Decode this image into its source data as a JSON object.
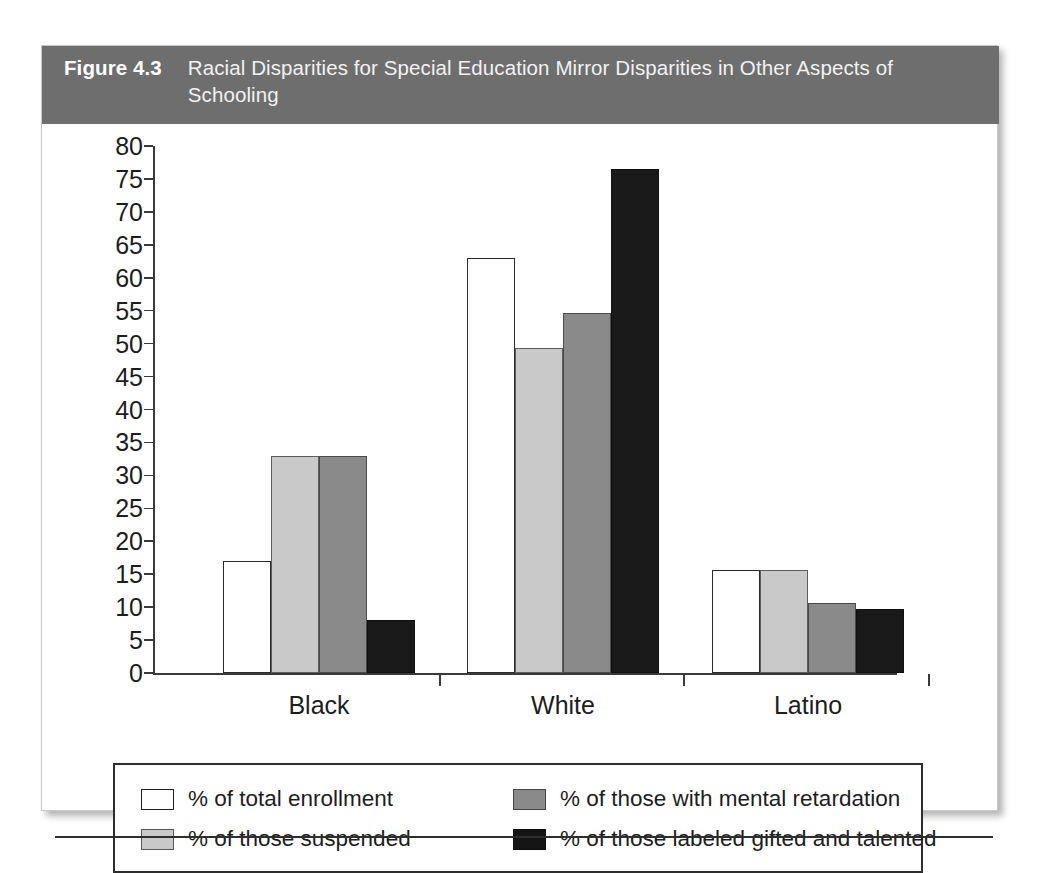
{
  "figure": {
    "number": "Figure 4.3",
    "title": "Racial Disparities for Special Education Mirror Disparities in Other Aspects of Schooling"
  },
  "chart_data": {
    "type": "bar",
    "title": "Racial Disparities for Special Education Mirror Disparities in Other Aspects of Schooling",
    "xlabel": "",
    "ylabel": "",
    "ylim": [
      0,
      80
    ],
    "ytick_step": 5,
    "yticks": [
      0,
      5,
      10,
      15,
      20,
      25,
      30,
      35,
      40,
      45,
      50,
      55,
      60,
      65,
      70,
      75,
      80
    ],
    "grid": false,
    "legend_position": "bottom",
    "categories": [
      "Black",
      "White",
      "Latino"
    ],
    "series": [
      {
        "name": "% of total enrollment",
        "color": "#ffffff",
        "values": [
          17.0,
          63.0,
          15.7
        ]
      },
      {
        "name": "% of those suspended",
        "color": "#c9c9c9",
        "values": [
          33.0,
          49.3,
          15.7
        ]
      },
      {
        "name": "% of those with mental retardation",
        "color": "#8a8a8a",
        "values": [
          33.0,
          54.6,
          10.6
        ]
      },
      {
        "name": "% of those labeled gifted and talented",
        "color": "#1a1a1a",
        "values": [
          8.1,
          76.5,
          9.7
        ]
      }
    ]
  },
  "colors": {
    "header_background": "#6e6e6e",
    "header_text": "#ffffff",
    "axis": "#3a3a3a",
    "page_background": "#ffffff"
  }
}
